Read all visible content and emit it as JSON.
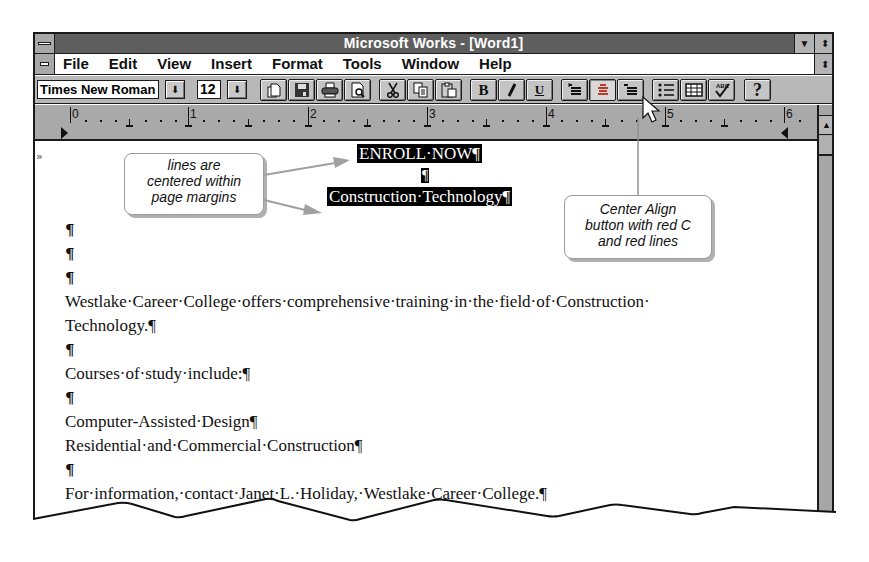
{
  "window": {
    "title": "Microsoft Works - [Word1]",
    "maximize_icon": "▼",
    "restore_icon": "⬍"
  },
  "menu": {
    "items": [
      {
        "label": "File",
        "accel": "F"
      },
      {
        "label": "Edit",
        "accel": "E"
      },
      {
        "label": "View",
        "accel": "V"
      },
      {
        "label": "Insert",
        "accel": "I"
      },
      {
        "label": "Format",
        "accel": "t"
      },
      {
        "label": "Tools",
        "accel": "o"
      },
      {
        "label": "Window",
        "accel": "W"
      },
      {
        "label": "Help",
        "accel": "H"
      }
    ]
  },
  "toolbar": {
    "font_name": "Times New Roman",
    "font_size": "12",
    "dropdown_icon": "⬇",
    "buttons": [
      {
        "name": "new-document",
        "glyph": "🗋"
      },
      {
        "name": "save",
        "glyph": "💾"
      },
      {
        "name": "print",
        "glyph": "🖶"
      },
      {
        "name": "print-preview",
        "glyph": "🔍"
      },
      {
        "name": "cut",
        "glyph": "✂"
      },
      {
        "name": "copy",
        "glyph": "⧉"
      },
      {
        "name": "paste",
        "glyph": "📋"
      },
      {
        "name": "bold",
        "glyph": "B"
      },
      {
        "name": "italic",
        "glyph": "/"
      },
      {
        "name": "underline",
        "glyph": "U"
      },
      {
        "name": "left-align",
        "glyph": "☰"
      },
      {
        "name": "center-align",
        "glyph": "≡"
      },
      {
        "name": "right-align",
        "glyph": "☰"
      },
      {
        "name": "bullets",
        "glyph": "⋮☰"
      },
      {
        "name": "insert-table",
        "glyph": "▦"
      },
      {
        "name": "spelling-check",
        "glyph": "✓"
      },
      {
        "name": "help",
        "glyph": "?"
      }
    ]
  },
  "ruler": {
    "numbers": [
      "0",
      "1",
      "2",
      "3",
      "4",
      "5",
      "6"
    ],
    "up_arrow": "▲"
  },
  "document": {
    "margin_marker": "»",
    "heading1": "ENROLL·NOW¶",
    "heading_blank": "¶",
    "heading2": "Construction·Technology¶",
    "lines": [
      "¶",
      "¶",
      "¶",
      "Westlake·Career·College·offers·comprehensive·training·in·the·field·of·Construction·",
      "Technology.¶",
      "¶",
      "Courses·of·study·include:¶",
      "¶",
      "Computer-Assisted·Design¶",
      "Residential·and·Commercial·Construction¶",
      "¶",
      "For·information,·contact·Janet·L.·Holiday,·Westlake·Career·College.¶"
    ]
  },
  "callouts": {
    "centered": "lines are centered within page margins",
    "centered_lines": [
      "lines are",
      "centered within",
      "page margins"
    ],
    "center_align_lines": [
      "Center Align",
      "button with red C",
      "and red lines"
    ]
  },
  "colors": {
    "titlebar": "#5e5e5e",
    "toolbar": "#b8b8b8",
    "ruler": "#a9a9a9",
    "selection": "#000000",
    "callout_border": "#9a9a9a"
  }
}
